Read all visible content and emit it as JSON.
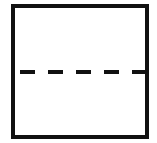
{
  "diagram": {
    "shape": "square",
    "divider": "dashed-horizontal",
    "colors": {
      "stroke": "#111111",
      "fill": "#ffffff"
    },
    "dashes": [
      {
        "x": 20,
        "w": 15
      },
      {
        "x": 48,
        "w": 15
      },
      {
        "x": 76,
        "w": 15
      },
      {
        "x": 104,
        "w": 15
      },
      {
        "x": 132,
        "w": 13
      }
    ]
  }
}
